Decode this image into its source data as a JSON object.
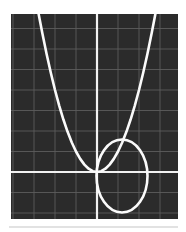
{
  "figure": {
    "name": "math-plot-parabola-and-circle",
    "page_background": "#ffffff",
    "width": 186,
    "height": 232
  },
  "plot_area": {
    "x": 11,
    "y": 14,
    "width": 167,
    "height": 205,
    "background_color": "#2b2b2b",
    "grid_color": "#5c5c5c",
    "grid_line_width": 0.9,
    "axis_color": "#f2f2f2",
    "axis_line_width": 2.2,
    "curve_color": "#fafafa",
    "curve_line_width": 2.6
  },
  "divider": {
    "label": "bottom-rule",
    "color": "#d8d8d8",
    "y": 227,
    "x_start": 9,
    "x_end": 178,
    "thickness": 1.6
  },
  "chart_data": {
    "type": "line",
    "title": "",
    "subtitle": "",
    "xlabel": "",
    "ylabel": "",
    "grid": true,
    "legend_position": "none",
    "tick_labels_visible": false,
    "axis_pixels": {
      "y_axis_x": 97,
      "x_axis_y": 172
    },
    "grid_spacing_px": {
      "x": 21,
      "y": 20.5
    },
    "grid_columns": 8,
    "grid_rows": 10,
    "xlim": [
      -4.1,
      3.85
    ],
    "ylim": [
      -2.29,
      7.71
    ],
    "annotations": [],
    "series": [
      {
        "name": "parabola",
        "kind": "parabola",
        "equation": "y = x^2",
        "vertex": [
          0,
          0
        ],
        "opens": "up",
        "color": "#fafafa",
        "x": [
          -2.78,
          -2.6,
          -2.4,
          -2.2,
          -2.0,
          -1.8,
          -1.6,
          -1.4,
          -1.2,
          -1.0,
          -0.8,
          -0.6,
          -0.4,
          -0.2,
          0.0,
          0.2,
          0.4,
          0.6,
          0.8,
          1.0,
          1.2,
          1.4,
          1.6,
          1.8,
          2.0,
          2.2,
          2.4,
          2.6,
          2.78
        ],
        "values": [
          7.71,
          6.76,
          5.76,
          4.84,
          4.0,
          3.24,
          2.56,
          1.96,
          1.44,
          1.0,
          0.64,
          0.36,
          0.16,
          0.04,
          0.0,
          0.04,
          0.16,
          0.36,
          0.64,
          1.0,
          1.44,
          1.96,
          2.56,
          3.24,
          4.0,
          4.84,
          5.76,
          6.76,
          7.71
        ]
      },
      {
        "name": "circle",
        "kind": "circle",
        "equation": "(x - 1.2)^2 + (y - 0.2)^2 = 1.45^2",
        "center": [
          1.2,
          0.2
        ],
        "radius": 1.45,
        "center_px": [
          122,
          176
        ],
        "radius_px_x": 25.5,
        "radius_px_y": 36.5,
        "color": "#fafafa"
      }
    ]
  }
}
